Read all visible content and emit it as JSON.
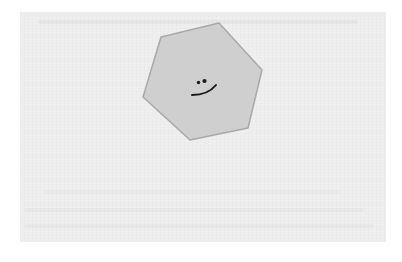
{
  "image": {
    "description": "Scanned paper page with a gray hexagon containing a small smiley face",
    "colors": {
      "background": "#ffffff",
      "paper": "#efefef",
      "hexagon_fill": "#cfcfcf",
      "hexagon_stroke": "#a9a9a9",
      "face_ink": "#1a1a1a"
    }
  },
  "figure": {
    "shape": "hexagon",
    "face": {
      "expression": "smile",
      "eyes": 2
    }
  }
}
